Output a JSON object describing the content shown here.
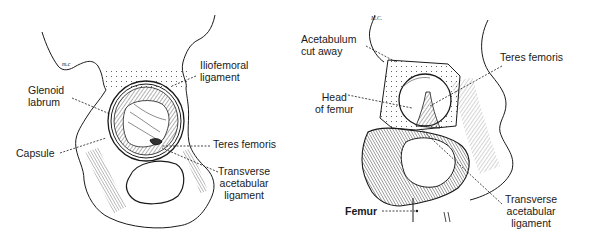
{
  "figure_left": {
    "signature": "M.C.",
    "labels": {
      "iliofemoral_1": "Iliofemoral",
      "iliofemoral_2": "ligament",
      "glenoid_1": "Glenoid",
      "glenoid_2": "labrum",
      "capsule": "Capsule",
      "teres": "Teres femoris",
      "transverse_1": "Transverse",
      "transverse_2": "acetabular",
      "transverse_3": "ligament"
    }
  },
  "figure_right": {
    "signature": "M.C.",
    "labels": {
      "acetabulum_1": "Acetabulum",
      "acetabulum_2": "cut away",
      "teres": "Teres femoris",
      "head_1": "Head",
      "head_2": "of femur",
      "transverse_1": "Transverse",
      "transverse_2": "acetabular",
      "transverse_3": "ligament",
      "femur": "Femur"
    }
  },
  "colors": {
    "ink": "#1a1a1a",
    "paper": "#ffffff"
  }
}
